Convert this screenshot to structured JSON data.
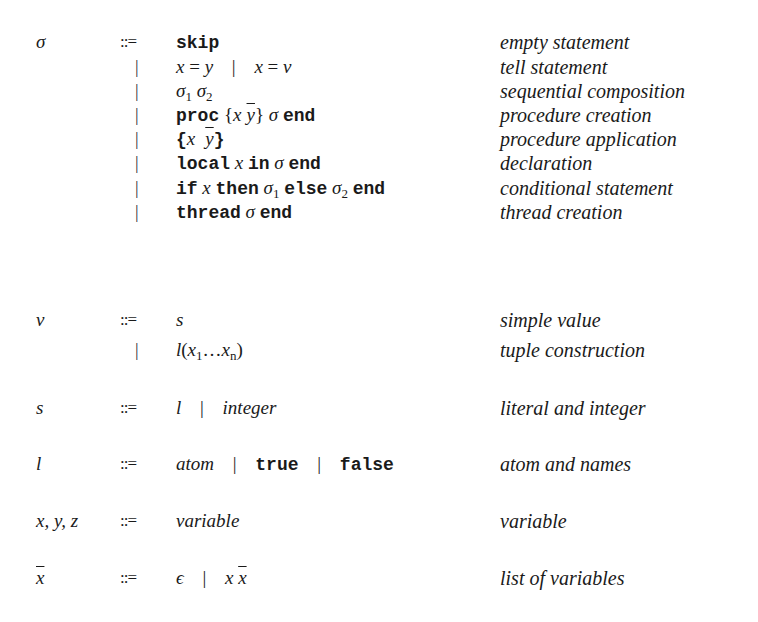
{
  "grammar": {
    "productions": [
      {
        "lhs": "σ",
        "op": "::=",
        "alt": "skip",
        "desc": "empty statement"
      },
      {
        "lhs": "",
        "op": "|",
        "alt": "x = y | x = v",
        "desc": "tell statement"
      },
      {
        "lhs": "",
        "op": "|",
        "alt": "σ1 σ2",
        "desc": "sequential composition"
      },
      {
        "lhs": "",
        "op": "|",
        "alt": "proc {x ȳ} σ end",
        "desc": "procedure creation"
      },
      {
        "lhs": "",
        "op": "|",
        "alt": "{x ȳ}",
        "desc": "procedure application"
      },
      {
        "lhs": "",
        "op": "|",
        "alt": "local x in σ end",
        "desc": "declaration"
      },
      {
        "lhs": "",
        "op": "|",
        "alt": "if x then σ1 else σ2 end",
        "desc": "conditional statement"
      },
      {
        "lhs": "",
        "op": "|",
        "alt": "thread σ end",
        "desc": "thread creation"
      },
      {
        "lhs": "v",
        "op": "::=",
        "alt": "s",
        "desc": "simple value"
      },
      {
        "lhs": "",
        "op": "|",
        "alt": "l(x1 … xn)",
        "desc": "tuple construction"
      },
      {
        "lhs": "s",
        "op": "::=",
        "alt": "l | integer",
        "desc": "literal and integer"
      },
      {
        "lhs": "l",
        "op": "::=",
        "alt": "atom | true | false",
        "desc": "atom and names"
      },
      {
        "lhs": "x, y, z",
        "op": "::=",
        "alt": "variable",
        "desc": "variable"
      },
      {
        "lhs": "x̄",
        "op": "::=",
        "alt": "ε | x x̄",
        "desc": "list of variables"
      }
    ],
    "tokens": {
      "sigma": "σ",
      "defines": "::=",
      "bar": "|",
      "skip": "skip",
      "proc": "proc",
      "end": "end",
      "local": "local",
      "in": "in",
      "if": "if",
      "then": "then",
      "else": "else",
      "thread": "thread",
      "true": "true",
      "false": "false",
      "x": "x",
      "y": "y",
      "v": "v",
      "s": "s",
      "l": "l",
      "n": "n",
      "one": "1",
      "two": "2",
      "eq": "=",
      "lbrace": "{",
      "rbrace": "}",
      "lparen": "(",
      "rparen": ")",
      "dots": "…",
      "integer": "integer",
      "atom": "atom",
      "variable": "variable",
      "epsilon": "ϵ",
      "xyz": "x, y, z"
    }
  }
}
